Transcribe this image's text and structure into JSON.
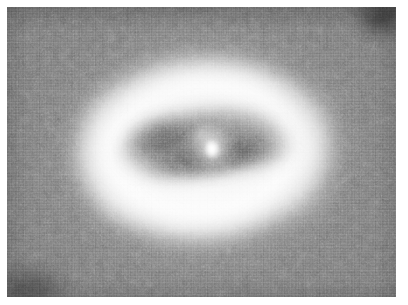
{
  "figure": {
    "kind": "astronomical-grayscale-image",
    "canvas": {
      "width": 408,
      "height": 305,
      "page_background": "#ffffff"
    },
    "plate": {
      "left": 7,
      "top": 7,
      "width": 389,
      "height": 290,
      "background_gray": "#767676",
      "rendering": "monochrome, heavy blocky compression grain"
    },
    "features": [
      {
        "name": "outer-halo",
        "description": "broad diffuse elliptical starlight halo",
        "center_x": 202,
        "center_y": 150,
        "width": 330,
        "height": 258,
        "rotation_deg": -3,
        "peak_color": "#ffffff"
      },
      {
        "name": "bright-annulus",
        "description": "bright ring of starlight surrounding the dark disk",
        "center_x": 202,
        "center_y": 149,
        "width": 268,
        "height": 196,
        "rotation_deg": -4,
        "peak_color": "#fbfbfb"
      },
      {
        "name": "dust-disk",
        "description": "dark inclined dust torus silhouetted against the halo",
        "center_x": 200,
        "center_y": 142,
        "width": 176,
        "height": 74,
        "rotation_deg": -9,
        "darkest_color": "#8d8d8d"
      },
      {
        "name": "nucleus",
        "description": "bright unresolved central point source",
        "center_x": 205,
        "center_y": 143,
        "width": 15,
        "height": 21,
        "color": "#ffffff"
      },
      {
        "name": "corner-vignette-top-right",
        "description": "dark plate defect in the upper right corner",
        "color": "#303030"
      },
      {
        "name": "corner-vignette-bottom-left",
        "description": "dark plate defect in the lower left corner",
        "color": "#4a4a4a"
      }
    ],
    "palette": {
      "page": "#ffffff",
      "sky": "#767676",
      "dust": "#8d8d8d",
      "halo": "#f2f2f2",
      "core": "#ffffff",
      "vignette": "#2e2e2e"
    }
  }
}
